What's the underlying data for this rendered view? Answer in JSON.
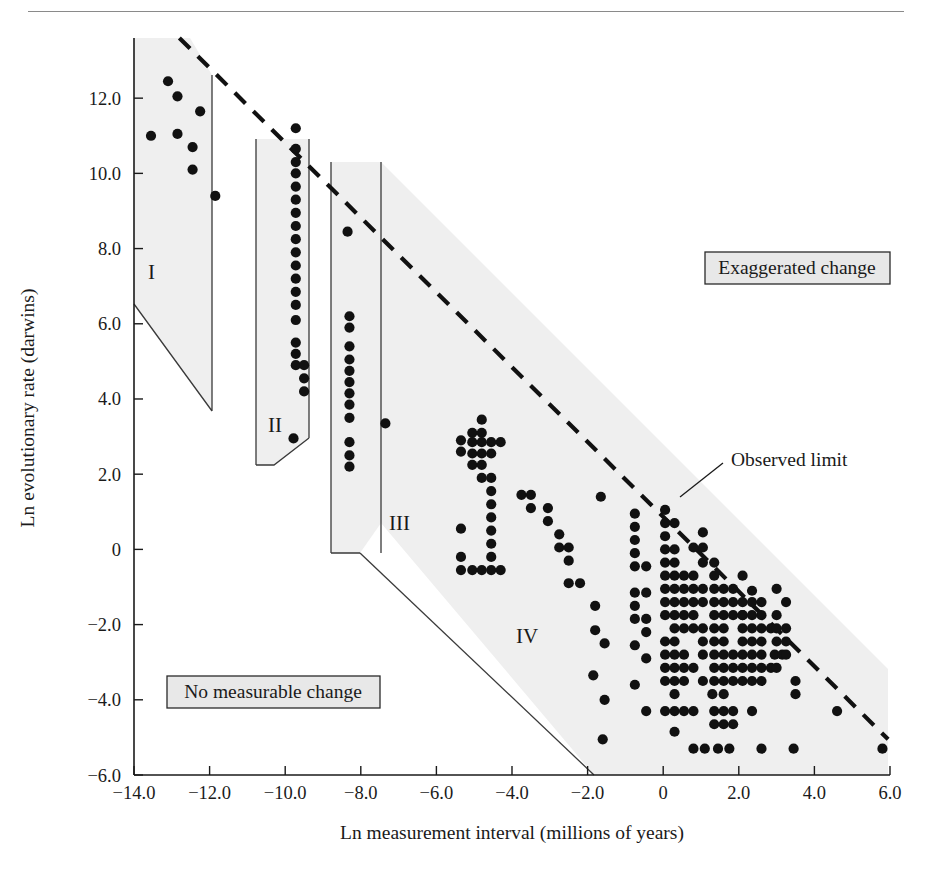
{
  "chart_data": {
    "type": "scatter",
    "title": "",
    "xlabel": "Ln measurement interval (millions of years)",
    "ylabel": "Ln evolutionary rate (darwins)",
    "xlim": [
      -14.0,
      6.0
    ],
    "ylim": [
      -6.0,
      13.6
    ],
    "xticks": [
      -14.0,
      -12.0,
      -10.0,
      -8.0,
      -6.0,
      -4.0,
      -2.0,
      0,
      2.0,
      4.0,
      6.0
    ],
    "xticklabels": [
      "−14.0",
      "−12.0",
      "−10.0",
      "−8.0",
      "−6.0",
      "−4.0",
      "−2.0",
      "0",
      "2.0",
      "4.0",
      "6.0"
    ],
    "yticks": [
      -6.0,
      -4.0,
      -2.0,
      0,
      2.0,
      4.0,
      6.0,
      8.0,
      10.0,
      12.0
    ],
    "yticklabels": [
      "−6.0",
      "−4.0",
      "−2.0",
      "0",
      "2.0",
      "4.0",
      "6.0",
      "8.0",
      "10.0",
      "12.0"
    ],
    "grid": false,
    "legend_position": "none",
    "accent_color": "#111111",
    "region_fill_color": "#efefef",
    "observed_limit_line": {
      "label": "Observed limit",
      "style": "dashed",
      "from": [
        -12.8,
        13.6
      ],
      "to": [
        5.95,
        -5.05
      ]
    },
    "annotations": [
      {
        "name": "exaggerated-change",
        "text": "Exaggerated change",
        "boxed": true
      },
      {
        "name": "no-measurable-change",
        "text": "No measurable change",
        "boxed": true
      },
      {
        "name": "observed-limit",
        "text": "Observed limit",
        "boxed": false
      }
    ],
    "regions": [
      {
        "label": "I",
        "x_range": [
          -14.0,
          -11.0
        ]
      },
      {
        "label": "II",
        "x_range": [
          -10.0,
          -7.9
        ]
      },
      {
        "label": "III",
        "x_range": [
          -7.6,
          -4.55
        ]
      },
      {
        "label": "IV",
        "x_range": [
          -4.55,
          6.0
        ]
      }
    ],
    "series": [
      {
        "name": "Evolutionary rate observations",
        "marker": "filled-circle",
        "color": "#111111",
        "points": [
          [
            -13.1,
            12.45
          ],
          [
            -12.85,
            12.05
          ],
          [
            -12.25,
            11.65
          ],
          [
            -13.55,
            11.0
          ],
          [
            -12.85,
            11.05
          ],
          [
            -12.45,
            10.7
          ],
          [
            -12.45,
            10.1
          ],
          [
            -11.85,
            9.4
          ],
          [
            -9.72,
            11.2
          ],
          [
            -9.72,
            10.65
          ],
          [
            -9.72,
            10.3
          ],
          [
            -9.72,
            10.0
          ],
          [
            -9.72,
            9.65
          ],
          [
            -9.72,
            9.3
          ],
          [
            -9.72,
            8.95
          ],
          [
            -9.72,
            8.6
          ],
          [
            -9.72,
            8.25
          ],
          [
            -9.72,
            7.9
          ],
          [
            -9.72,
            7.55
          ],
          [
            -9.72,
            7.2
          ],
          [
            -9.72,
            6.85
          ],
          [
            -9.72,
            6.5
          ],
          [
            -9.72,
            6.1
          ],
          [
            -9.72,
            5.5
          ],
          [
            -9.72,
            5.2
          ],
          [
            -9.72,
            4.9
          ],
          [
            -9.5,
            4.9
          ],
          [
            -9.5,
            4.55
          ],
          [
            -9.5,
            4.2
          ],
          [
            -9.78,
            2.95
          ],
          [
            -8.35,
            8.45
          ],
          [
            -8.3,
            6.2
          ],
          [
            -8.3,
            5.9
          ],
          [
            -8.3,
            5.4
          ],
          [
            -8.3,
            5.05
          ],
          [
            -8.3,
            4.75
          ],
          [
            -8.3,
            4.45
          ],
          [
            -8.3,
            4.15
          ],
          [
            -8.3,
            3.85
          ],
          [
            -8.3,
            3.5
          ],
          [
            -8.3,
            2.85
          ],
          [
            -8.3,
            2.5
          ],
          [
            -8.3,
            2.2
          ],
          [
            -7.35,
            3.35
          ],
          [
            -5.35,
            2.9
          ],
          [
            -5.35,
            2.6
          ],
          [
            -5.05,
            3.1
          ],
          [
            -5.05,
            2.85
          ],
          [
            -5.05,
            2.55
          ],
          [
            -5.05,
            2.25
          ],
          [
            -4.8,
            3.45
          ],
          [
            -4.8,
            3.1
          ],
          [
            -4.8,
            2.85
          ],
          [
            -4.8,
            2.55
          ],
          [
            -4.8,
            2.25
          ],
          [
            -4.8,
            1.9
          ],
          [
            -4.55,
            2.85
          ],
          [
            -4.55,
            2.55
          ],
          [
            -4.55,
            1.9
          ],
          [
            -4.55,
            1.55
          ],
          [
            -4.55,
            1.2
          ],
          [
            -4.55,
            0.85
          ],
          [
            -4.55,
            0.5
          ],
          [
            -4.55,
            0.15
          ],
          [
            -4.55,
            -0.2
          ],
          [
            -4.55,
            -0.55
          ],
          [
            -4.3,
            2.85
          ],
          [
            -5.35,
            0.55
          ],
          [
            -5.35,
            -0.2
          ],
          [
            -5.35,
            -0.55
          ],
          [
            -5.05,
            -0.55
          ],
          [
            -4.8,
            -0.55
          ],
          [
            -4.3,
            -0.55
          ],
          [
            -3.75,
            1.45
          ],
          [
            -3.5,
            1.45
          ],
          [
            -3.5,
            1.1
          ],
          [
            -3.05,
            1.1
          ],
          [
            -3.05,
            0.75
          ],
          [
            -2.75,
            0.4
          ],
          [
            -2.75,
            0.05
          ],
          [
            -2.5,
            0.05
          ],
          [
            -2.5,
            -0.3
          ],
          [
            -2.5,
            -0.9
          ],
          [
            -2.2,
            -0.9
          ],
          [
            -1.65,
            1.4
          ],
          [
            -1.8,
            -1.5
          ],
          [
            -1.8,
            -2.15
          ],
          [
            -1.55,
            -2.5
          ],
          [
            -1.85,
            -3.35
          ],
          [
            -1.55,
            -4.0
          ],
          [
            -1.6,
            -5.05
          ],
          [
            -0.75,
            0.95
          ],
          [
            -0.75,
            0.6
          ],
          [
            -0.75,
            0.25
          ],
          [
            -0.75,
            -0.1
          ],
          [
            -0.75,
            -0.45
          ],
          [
            -0.75,
            -1.15
          ],
          [
            -0.45,
            -0.45
          ],
          [
            -0.45,
            -1.15
          ],
          [
            -0.75,
            -1.5
          ],
          [
            -0.75,
            -1.85
          ],
          [
            -0.45,
            -1.85
          ],
          [
            -0.45,
            -2.2
          ],
          [
            -0.75,
            -2.55
          ],
          [
            -0.45,
            -2.9
          ],
          [
            -0.75,
            -3.6
          ],
          [
            -0.45,
            -4.3
          ],
          [
            0.05,
            1.05
          ],
          [
            0.05,
            0.7
          ],
          [
            0.3,
            0.7
          ],
          [
            0.05,
            0.35
          ],
          [
            0.05,
            0.0
          ],
          [
            0.3,
            0.0
          ],
          [
            0.05,
            -0.35
          ],
          [
            0.3,
            -0.35
          ],
          [
            0.05,
            -0.7
          ],
          [
            0.3,
            -0.7
          ],
          [
            0.55,
            -0.7
          ],
          [
            0.8,
            -0.7
          ],
          [
            0.05,
            -1.05
          ],
          [
            0.3,
            -1.05
          ],
          [
            0.55,
            -1.05
          ],
          [
            0.8,
            -1.05
          ],
          [
            0.05,
            -1.4
          ],
          [
            0.3,
            -1.4
          ],
          [
            0.55,
            -1.4
          ],
          [
            0.8,
            -1.4
          ],
          [
            0.05,
            -1.75
          ],
          [
            0.3,
            -1.75
          ],
          [
            0.55,
            -1.75
          ],
          [
            0.8,
            -1.75
          ],
          [
            0.3,
            -2.1
          ],
          [
            0.55,
            -2.1
          ],
          [
            0.8,
            -2.1
          ],
          [
            0.05,
            -2.45
          ],
          [
            0.3,
            -2.45
          ],
          [
            0.05,
            -2.8
          ],
          [
            0.3,
            -2.8
          ],
          [
            0.55,
            -2.8
          ],
          [
            0.05,
            -3.15
          ],
          [
            0.3,
            -3.15
          ],
          [
            0.55,
            -3.15
          ],
          [
            0.8,
            -3.15
          ],
          [
            0.05,
            -3.5
          ],
          [
            0.3,
            -3.5
          ],
          [
            0.55,
            -3.5
          ],
          [
            0.3,
            -3.85
          ],
          [
            0.05,
            -4.3
          ],
          [
            0.3,
            -4.3
          ],
          [
            0.55,
            -4.3
          ],
          [
            0.8,
            -4.3
          ],
          [
            0.3,
            -4.85
          ],
          [
            0.8,
            -5.3
          ],
          [
            1.05,
            0.45
          ],
          [
            1.05,
            0.05
          ],
          [
            0.8,
            0.05
          ],
          [
            1.05,
            -0.35
          ],
          [
            1.35,
            -0.35
          ],
          [
            1.35,
            -0.7
          ],
          [
            1.05,
            -1.05
          ],
          [
            1.35,
            -1.05
          ],
          [
            1.6,
            -1.05
          ],
          [
            1.85,
            -1.05
          ],
          [
            1.05,
            -1.4
          ],
          [
            1.35,
            -1.4
          ],
          [
            1.6,
            -1.4
          ],
          [
            1.85,
            -1.4
          ],
          [
            1.35,
            -1.75
          ],
          [
            1.6,
            -1.75
          ],
          [
            1.85,
            -1.75
          ],
          [
            2.1,
            -1.75
          ],
          [
            1.05,
            -2.1
          ],
          [
            1.35,
            -2.1
          ],
          [
            1.6,
            -2.1
          ],
          [
            1.05,
            -2.45
          ],
          [
            1.35,
            -2.45
          ],
          [
            1.6,
            -2.45
          ],
          [
            1.05,
            -2.8
          ],
          [
            1.35,
            -2.8
          ],
          [
            1.6,
            -2.8
          ],
          [
            1.85,
            -2.8
          ],
          [
            1.35,
            -3.15
          ],
          [
            1.6,
            -3.15
          ],
          [
            1.85,
            -3.15
          ],
          [
            1.05,
            -3.5
          ],
          [
            1.35,
            -3.5
          ],
          [
            1.6,
            -3.5
          ],
          [
            1.85,
            -3.5
          ],
          [
            1.3,
            -3.85
          ],
          [
            1.6,
            -3.85
          ],
          [
            1.35,
            -4.3
          ],
          [
            1.6,
            -4.3
          ],
          [
            1.85,
            -4.3
          ],
          [
            1.35,
            -4.65
          ],
          [
            1.6,
            -4.65
          ],
          [
            1.85,
            -4.65
          ],
          [
            1.1,
            -5.3
          ],
          [
            1.45,
            -5.3
          ],
          [
            1.75,
            -5.3
          ],
          [
            2.1,
            -0.7
          ],
          [
            2.35,
            -1.1
          ],
          [
            2.1,
            -1.4
          ],
          [
            2.35,
            -1.4
          ],
          [
            2.6,
            -1.4
          ],
          [
            2.1,
            -1.75
          ],
          [
            2.35,
            -1.75
          ],
          [
            2.6,
            -1.75
          ],
          [
            2.1,
            -2.1
          ],
          [
            2.35,
            -2.1
          ],
          [
            2.6,
            -2.1
          ],
          [
            2.85,
            -2.1
          ],
          [
            2.1,
            -2.45
          ],
          [
            2.35,
            -2.45
          ],
          [
            2.6,
            -2.45
          ],
          [
            2.1,
            -2.8
          ],
          [
            2.35,
            -2.8
          ],
          [
            2.6,
            -2.8
          ],
          [
            2.1,
            -3.15
          ],
          [
            2.35,
            -3.15
          ],
          [
            2.6,
            -3.15
          ],
          [
            2.85,
            -3.15
          ],
          [
            2.1,
            -3.5
          ],
          [
            2.35,
            -3.5
          ],
          [
            2.6,
            -3.5
          ],
          [
            2.35,
            -4.3
          ],
          [
            2.6,
            -5.3
          ],
          [
            3.0,
            -1.05
          ],
          [
            3.0,
            -1.75
          ],
          [
            3.0,
            -2.1
          ],
          [
            3.0,
            -2.45
          ],
          [
            2.95,
            -2.8
          ],
          [
            3.15,
            -2.8
          ],
          [
            3.0,
            -3.15
          ],
          [
            3.25,
            -1.4
          ],
          [
            3.25,
            -2.1
          ],
          [
            3.25,
            -2.45
          ],
          [
            3.25,
            -2.8
          ],
          [
            3.5,
            -3.5
          ],
          [
            3.5,
            -3.85
          ],
          [
            3.45,
            -5.3
          ],
          [
            4.6,
            -4.3
          ],
          [
            5.8,
            -5.3
          ]
        ]
      }
    ]
  },
  "axis": {
    "x_title": "Ln measurement interval (millions of years)",
    "y_title": "Ln evolutionary rate (darwins)"
  },
  "labels": {
    "region_1": "I",
    "region_2": "II",
    "region_3": "III",
    "region_4": "IV",
    "exaggerated_change": "Exaggerated change",
    "no_measurable_change": "No measurable change",
    "observed_limit": "Observed limit"
  }
}
